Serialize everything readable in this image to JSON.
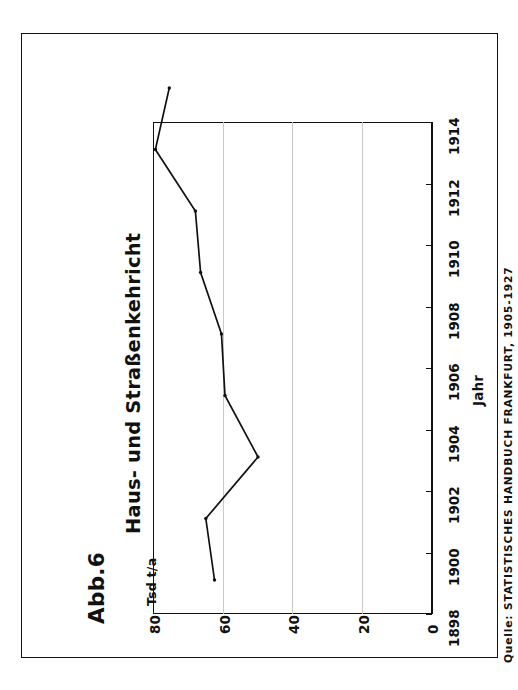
{
  "figure": {
    "number_label": "Abb.6",
    "title_line1": "Haus- und Straßenkehricht",
    "title_line2": "in Frankfurt 1898 - 1914",
    "source_note": "Quelle: STATISTISCHES HANDBUCH FRANKFURT, 1905-1927"
  },
  "chart_data": {
    "type": "line",
    "title": "Haus- und Straßenkehricht in Frankfurt 1898 - 1914",
    "xlabel": "Jahr",
    "ylabel": "Tsd t/a",
    "x": [
      1898,
      1900,
      1902,
      1904,
      1906,
      1908,
      1910,
      1912,
      1914
    ],
    "values": [
      56,
      58.5,
      43.5,
      53,
      54,
      60,
      61.5,
      73,
      69
    ],
    "xlim": [
      1898,
      1914
    ],
    "ylim": [
      0,
      80
    ],
    "xticks": [
      "1898",
      "1900",
      "1902",
      "1904",
      "1906",
      "1908",
      "1910",
      "1912",
      "1914"
    ],
    "yticks": [
      "0",
      "20",
      "40",
      "60",
      "80"
    ],
    "grid": "value-gridlines-only",
    "legend": "none",
    "orientation": "rotated-90-ccw",
    "line_color": "#111111",
    "marker": "point"
  },
  "axes": {
    "value_axis_title": "Tsd t/a",
    "year_axis_title": "Jahr",
    "value_ticks": [
      "80",
      "60",
      "40",
      "20",
      "0"
    ],
    "year_ticks": [
      "1898",
      "1900",
      "1902",
      "1904",
      "1906",
      "1908",
      "1910",
      "1912",
      "1914"
    ]
  },
  "colors": {
    "ink": "#111111",
    "grid": "#c9c9c9",
    "paper": "#ffffff"
  }
}
